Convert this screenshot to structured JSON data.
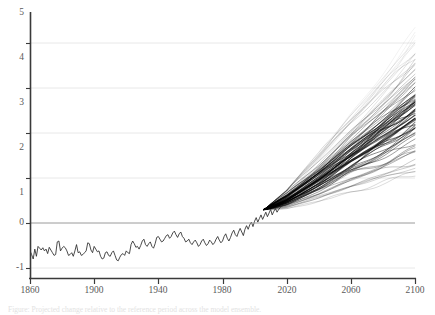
{
  "chart_data": {
    "type": "line",
    "title": "",
    "subtitle": "",
    "xlabel": "",
    "ylabel": "",
    "xlim": [
      1860,
      2100
    ],
    "ylim": [
      -1.35,
      5.15
    ],
    "grid": true,
    "grid_axis": "y",
    "legend": "none",
    "zero_line": 0,
    "xticks": [
      1860,
      1900,
      1940,
      1980,
      2020,
      2060,
      2100
    ],
    "xtick_labels": [
      "1860",
      "1900",
      "1940",
      "1980",
      "2020",
      "2060",
      "2100"
    ],
    "yticks": [
      -1,
      0,
      1,
      2,
      3,
      4,
      5
    ],
    "ytick_labels": [
      "-1",
      "0",
      "1",
      "2",
      "3",
      "4",
      "5"
    ],
    "colors": {
      "background": "#ffffff",
      "axis": "#3a3a3a",
      "gridline": "#e8e8e8",
      "zero_line": "#9a9a9a",
      "historical_line": "#2b2b2b",
      "ensemble_line": "#000000",
      "tick_text": "#5a5a5a"
    },
    "series": [
      {
        "name": "Historical observations",
        "type": "line",
        "color": "#2b2b2b",
        "x_start": 1860,
        "x_end": 2006,
        "x_step": 1,
        "values": [
          -0.62,
          -0.7,
          -0.8,
          -0.58,
          -0.74,
          -0.52,
          -0.56,
          -0.6,
          -0.55,
          -0.62,
          -0.58,
          -0.68,
          -0.54,
          -0.6,
          -0.66,
          -0.72,
          -0.7,
          -0.42,
          -0.4,
          -0.62,
          -0.56,
          -0.52,
          -0.55,
          -0.62,
          -0.72,
          -0.7,
          -0.66,
          -0.74,
          -0.62,
          -0.48,
          -0.66,
          -0.64,
          -0.72,
          -0.7,
          -0.66,
          -0.62,
          -0.44,
          -0.46,
          -0.6,
          -0.66,
          -0.52,
          -0.58,
          -0.64,
          -0.62,
          -0.74,
          -0.8,
          -0.78,
          -0.66,
          -0.64,
          -0.72,
          -0.74,
          -0.66,
          -0.62,
          -0.72,
          -0.82,
          -0.84,
          -0.76,
          -0.7,
          -0.68,
          -0.72,
          -0.62,
          -0.66,
          -0.68,
          -0.48,
          -0.4,
          -0.46,
          -0.54,
          -0.52,
          -0.58,
          -0.5,
          -0.4,
          -0.36,
          -0.48,
          -0.52,
          -0.46,
          -0.42,
          -0.52,
          -0.56,
          -0.46,
          -0.32,
          -0.3,
          -0.36,
          -0.42,
          -0.4,
          -0.34,
          -0.28,
          -0.26,
          -0.34,
          -0.3,
          -0.22,
          -0.18,
          -0.26,
          -0.32,
          -0.24,
          -0.2,
          -0.3,
          -0.34,
          -0.42,
          -0.4,
          -0.36,
          -0.44,
          -0.48,
          -0.42,
          -0.38,
          -0.44,
          -0.52,
          -0.48,
          -0.4,
          -0.36,
          -0.44,
          -0.5,
          -0.46,
          -0.38,
          -0.42,
          -0.48,
          -0.44,
          -0.36,
          -0.3,
          -0.38,
          -0.44,
          -0.4,
          -0.3,
          -0.24,
          -0.34,
          -0.4,
          -0.32,
          -0.22,
          -0.16,
          -0.26,
          -0.3,
          -0.2,
          -0.12,
          -0.2,
          -0.28,
          -0.14,
          -0.06,
          -0.14,
          -0.04,
          0.02,
          -0.08,
          0.04,
          0.12,
          0.02,
          0.1,
          0.18,
          0.08,
          0.16,
          0.24,
          0.14,
          0.22,
          0.3,
          0.18,
          0.26,
          0.32,
          0.24,
          0.3,
          0.34
        ]
      },
      {
        "name": "Projection ensemble",
        "type": "ensemble-fan",
        "color": "#000000",
        "x_start": 2006,
        "x_end": 2100,
        "n_members": 84,
        "branch_value": 0.3,
        "spread_2020": [
          0.25,
          0.72
        ],
        "spread_2040": [
          0.45,
          1.55
        ],
        "spread_2060": [
          0.7,
          2.55
        ],
        "spread_2080": [
          0.9,
          3.4
        ],
        "spread_2100": [
          1.05,
          4.3
        ],
        "median_2100": 2.3,
        "core_band_2100": [
          2.05,
          2.6
        ]
      }
    ]
  },
  "axes": {
    "x_tick_values": [
      "1860",
      "1900",
      "1940",
      "1980",
      "2020",
      "2060",
      "2100"
    ],
    "y_tick_values": [
      "5",
      "4",
      "3",
      "2",
      "1",
      "0",
      "-1"
    ]
  },
  "caption": {
    "text": "Figure: Projected change relative to the reference period across the model ensemble."
  }
}
